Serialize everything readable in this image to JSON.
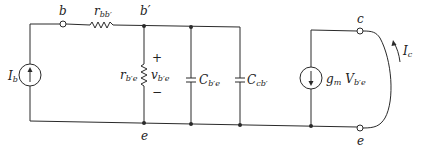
{
  "diagram": {
    "nodes": {
      "b": "b",
      "b_prime": "b′",
      "e_bottom": "e",
      "c_terminal": "c",
      "e_terminal": "e"
    },
    "components": {
      "source_ib": {
        "symbol": "I",
        "sub": "b"
      },
      "r_bb": {
        "symbol": "r",
        "sub": "bb′"
      },
      "r_be": {
        "symbol": "r",
        "sub": "b′e"
      },
      "v_be": {
        "symbol": "v",
        "sub": "b′e",
        "plus": "+",
        "minus": "−"
      },
      "c_be": {
        "symbol": "C",
        "sub": "b′e"
      },
      "c_cb": {
        "symbol": "C",
        "sub": "cb′"
      },
      "gm_source": {
        "gm": "g",
        "gm_sub": "m",
        "v": "V",
        "v_sub": "b′e"
      },
      "ic": {
        "symbol": "I",
        "sub": "c"
      }
    },
    "colors": {
      "line": "#2a2a2a",
      "background": "#ffffff"
    }
  }
}
